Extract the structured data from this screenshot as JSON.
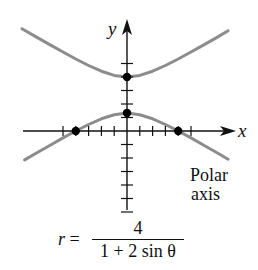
{
  "chart_data": {
    "type": "line",
    "title": "",
    "equation": {
      "lhs": "r =",
      "numerator": "4",
      "denominator": "1 + 2 sin θ"
    },
    "xlabel": "x",
    "ylabel": "y",
    "annotation": [
      "Polar",
      "axis"
    ],
    "grid": false,
    "legend": null,
    "xlim": [
      -8.2,
      8.2
    ],
    "ylim": [
      -6,
      8.3
    ],
    "x_ticks": [
      -5,
      -4,
      -3,
      -2,
      -1,
      1,
      2,
      3,
      4,
      5
    ],
    "y_ticks": [
      -6,
      -5,
      -4,
      -3,
      -2,
      -1,
      1,
      2,
      3,
      4,
      5
    ],
    "marked_points": [
      {
        "x": 0,
        "y": 4,
        "label": "vertex (upper branch)"
      },
      {
        "x": 0,
        "y": 1.333,
        "label": "vertex (lower branch)"
      },
      {
        "x": -4,
        "y": 0
      },
      {
        "x": 4,
        "y": 0
      }
    ],
    "series": [
      {
        "name": "upper branch",
        "color": "#8c8c8c",
        "x": [
          -8.2,
          -8,
          -7,
          -6,
          -5,
          -4,
          -3,
          -2,
          -1,
          0,
          1,
          2,
          3,
          4,
          5,
          6,
          7,
          7.9
        ],
        "y": [
          7.58,
          7.47,
          6.92,
          6.38,
          5.85,
          5.33,
          4.85,
          4.43,
          4.12,
          4.0,
          4.12,
          4.43,
          4.85,
          5.33,
          5.85,
          6.38,
          6.92,
          7.42
        ]
      },
      {
        "name": "lower branch",
        "color": "#8c8c8c",
        "x": [
          -8.0,
          -7,
          -6,
          -5,
          -4,
          -3,
          -2,
          -1,
          0,
          1,
          2,
          3,
          4,
          5,
          6,
          7,
          7.9
        ],
        "y": [
          -2.14,
          -1.59,
          -1.05,
          -0.51,
          0.0,
          0.48,
          0.9,
          1.21,
          1.33,
          1.21,
          0.9,
          0.48,
          0.0,
          -0.51,
          -1.05,
          -1.59,
          -2.09
        ]
      }
    ]
  },
  "colors": {
    "curve": "#8c8c8c",
    "axes": "#111111",
    "points": "#000000"
  }
}
